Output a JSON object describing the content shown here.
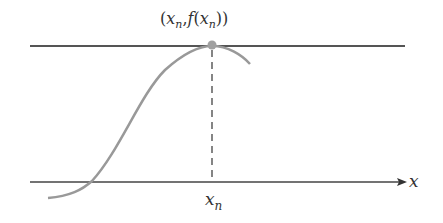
{
  "diagram": {
    "point_label": {
      "open": "(",
      "x": "x",
      "sub": "n",
      "comma": ",",
      "f": "f",
      "paren": "(",
      "x2": "x",
      "sub2": "n",
      "close": "))"
    },
    "tick_label": {
      "x": "x",
      "sub": "n"
    },
    "axis_label": "x",
    "colors": {
      "axis": "#444444",
      "tangent": "#555555",
      "curve": "#999999",
      "point": "#a0a0a0",
      "dashed": "#444444"
    }
  }
}
